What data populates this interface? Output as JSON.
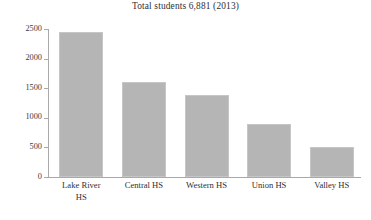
{
  "chart_data": {
    "type": "bar",
    "title": "Total students 6,881 (2013)",
    "xlabel": "",
    "ylabel": "",
    "categories": [
      "Lake River HS",
      "Central HS",
      "Western HS",
      "Union HS",
      "Valley HS"
    ],
    "category_lines": [
      [
        "Lake River",
        "HS"
      ],
      [
        "Central HS"
      ],
      [
        "Western HS"
      ],
      [
        "Union HS"
      ],
      [
        "Valley HS"
      ]
    ],
    "values": [
      2450,
      1610,
      1390,
      900,
      500
    ],
    "ylim": [
      0,
      2500
    ],
    "yticks": [
      0,
      500,
      1000,
      1500,
      2000,
      2500
    ],
    "ytick_labels": [
      "0",
      "500",
      "1000",
      "1500",
      "2000",
      "2500"
    ],
    "grid": false,
    "legend": null,
    "bar_color": "#b5b5b5",
    "bar_border_color": "#c6c6c6",
    "axis_color": "#a9a9a9",
    "text_color": "#2f2f2f"
  }
}
